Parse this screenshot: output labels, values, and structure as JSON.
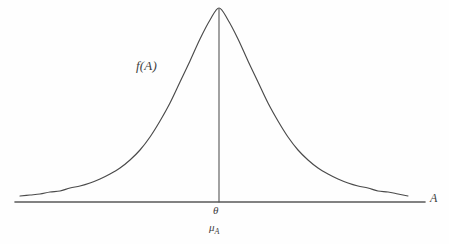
{
  "figure": {
    "kind": "probability-density-diagram",
    "background_color": "#fefefe",
    "line_color": "#4a4a4a",
    "text_color": "#3d3d3d",
    "labels": {
      "curve": "f(A)",
      "axis_x": "A",
      "center_tick": "θ",
      "center_mean": "μ",
      "center_mean_subscript": "A"
    }
  },
  "chart_data": {
    "type": "line",
    "title": "",
    "xlabel": "A",
    "ylabel": "f(A)",
    "grid": false,
    "legend": null,
    "annotations": [
      {
        "text": "f(A)",
        "x": 150,
        "y": 67,
        "style": "italic",
        "role": "curve-label"
      },
      {
        "text": "θ",
        "x": 219,
        "y": 211,
        "style": "italic",
        "role": "x-axis-tick-label"
      },
      {
        "text": "μₐ",
        "x": 219,
        "y": 228,
        "style": "italic",
        "role": "x-axis-mean-label"
      },
      {
        "text": "A",
        "x": 434,
        "y": 198,
        "style": "italic",
        "role": "x-axis-name"
      }
    ],
    "axis": {
      "x_line": {
        "x1": 15,
        "y1": 202,
        "x2": 425,
        "y2": 202
      },
      "center_line": {
        "x": 219,
        "y_top": 8,
        "y_bottom": 202
      },
      "x_range_px": [
        15,
        425
      ],
      "baseline_y_px": 202,
      "peak_px": {
        "x": 219,
        "y": 8
      }
    },
    "curve_points": [
      {
        "x": 20,
        "y": 196
      },
      {
        "x": 30,
        "y": 195
      },
      {
        "x": 40,
        "y": 194
      },
      {
        "x": 50,
        "y": 192
      },
      {
        "x": 60,
        "y": 191
      },
      {
        "x": 70,
        "y": 188
      },
      {
        "x": 80,
        "y": 186
      },
      {
        "x": 90,
        "y": 183
      },
      {
        "x": 100,
        "y": 179
      },
      {
        "x": 110,
        "y": 174
      },
      {
        "x": 120,
        "y": 168
      },
      {
        "x": 130,
        "y": 160
      },
      {
        "x": 140,
        "y": 150
      },
      {
        "x": 150,
        "y": 137
      },
      {
        "x": 160,
        "y": 121
      },
      {
        "x": 170,
        "y": 103
      },
      {
        "x": 180,
        "y": 82
      },
      {
        "x": 190,
        "y": 61
      },
      {
        "x": 200,
        "y": 39
      },
      {
        "x": 210,
        "y": 20
      },
      {
        "x": 219,
        "y": 8
      },
      {
        "x": 228,
        "y": 20
      },
      {
        "x": 238,
        "y": 39
      },
      {
        "x": 248,
        "y": 61
      },
      {
        "x": 258,
        "y": 82
      },
      {
        "x": 268,
        "y": 103
      },
      {
        "x": 278,
        "y": 121
      },
      {
        "x": 288,
        "y": 137
      },
      {
        "x": 298,
        "y": 150
      },
      {
        "x": 308,
        "y": 160
      },
      {
        "x": 318,
        "y": 168
      },
      {
        "x": 328,
        "y": 174
      },
      {
        "x": 338,
        "y": 179
      },
      {
        "x": 348,
        "y": 183
      },
      {
        "x": 358,
        "y": 186
      },
      {
        "x": 368,
        "y": 188
      },
      {
        "x": 378,
        "y": 191
      },
      {
        "x": 388,
        "y": 192
      },
      {
        "x": 398,
        "y": 194
      },
      {
        "x": 408,
        "y": 196
      }
    ]
  }
}
